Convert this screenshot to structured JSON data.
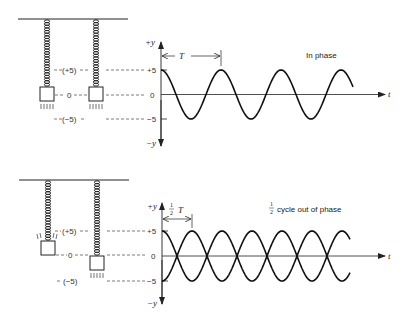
{
  "panels": [
    {
      "id": "in-phase",
      "caption": "In phase",
      "axis_labels": {
        "y_pos": "+y",
        "y_neg": "−y",
        "x": "t"
      },
      "ticks": [
        "+5",
        "0",
        "−5"
      ],
      "mass_labels": [
        "(+5)",
        "0",
        "(−5)"
      ],
      "period_label": "T",
      "period_fraction": ""
    },
    {
      "id": "out-of-phase",
      "caption": "cycle out of phase",
      "caption_fraction_num": "1",
      "caption_fraction_den": "2",
      "axis_labels": {
        "y_pos": "+y",
        "y_neg": "−y",
        "x": "t"
      },
      "ticks": [
        "+5",
        "0",
        "−5"
      ],
      "mass_labels": [
        "(+5)",
        "0",
        "(−5)"
      ],
      "period_label": "T",
      "period_fraction_num": "1",
      "period_fraction_den": "2"
    }
  ],
  "chart_data": [
    {
      "type": "line",
      "title": "In phase",
      "xlabel": "t",
      "ylabel": "y",
      "ylim": [
        -5,
        5
      ],
      "yticks": [
        5,
        0,
        -5
      ],
      "period_annotation": "T",
      "series": [
        {
          "name": "mass 1",
          "function": "5cos(2πt/T)",
          "cycles_shown": 3.2
        },
        {
          "name": "mass 2",
          "function": "5cos(2πt/T)",
          "cycles_shown": 3.2
        }
      ]
    },
    {
      "type": "line",
      "title": "1/2 cycle out of phase",
      "xlabel": "t",
      "ylabel": "y",
      "ylim": [
        -5,
        5
      ],
      "yticks": [
        5,
        0,
        -5
      ],
      "period_annotation": "1/2 T",
      "series": [
        {
          "name": "mass 1",
          "function": "5cos(2πt/T)",
          "cycles_shown": 3.2
        },
        {
          "name": "mass 2",
          "function": "-5cos(2πt/T)",
          "cycles_shown": 3.2
        }
      ]
    }
  ]
}
